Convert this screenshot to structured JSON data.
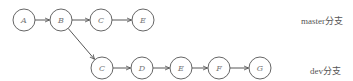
{
  "diagram": {
    "type": "git-branch-graph",
    "colors": {
      "stroke": "#555555",
      "text": "#777777",
      "background": "#ffffff"
    },
    "branches": [
      {
        "name": "master",
        "label": "master分支",
        "y": 20,
        "label_x": 301,
        "label_y": 14
      },
      {
        "name": "dev",
        "label": "dev分支",
        "y": 68,
        "label_x": 310,
        "label_y": 64
      }
    ],
    "nodes": [
      {
        "id": "m-A",
        "label": "A",
        "x": 24,
        "y": 20
      },
      {
        "id": "m-B",
        "label": "B",
        "x": 61,
        "y": 20
      },
      {
        "id": "m-C",
        "label": "C",
        "x": 101,
        "y": 20
      },
      {
        "id": "m-E",
        "label": "E",
        "x": 143,
        "y": 20
      },
      {
        "id": "d-C",
        "label": "C",
        "x": 102,
        "y": 68
      },
      {
        "id": "d-D",
        "label": "D",
        "x": 142,
        "y": 68
      },
      {
        "id": "d-E",
        "label": "E",
        "x": 181,
        "y": 68
      },
      {
        "id": "d-F",
        "label": "F",
        "x": 219,
        "y": 68
      },
      {
        "id": "d-G",
        "label": "G",
        "x": 260,
        "y": 68
      }
    ],
    "edges": [
      {
        "from": "m-A",
        "to": "m-B"
      },
      {
        "from": "m-B",
        "to": "m-C"
      },
      {
        "from": "m-C",
        "to": "m-E"
      },
      {
        "from": "m-B",
        "to": "d-C"
      },
      {
        "from": "d-C",
        "to": "d-D"
      },
      {
        "from": "d-D",
        "to": "d-E"
      },
      {
        "from": "d-E",
        "to": "d-F"
      },
      {
        "from": "d-F",
        "to": "d-G"
      }
    ],
    "node_radius": 11
  }
}
